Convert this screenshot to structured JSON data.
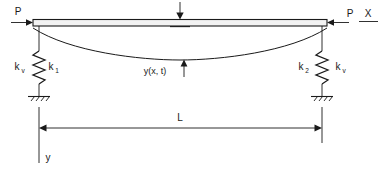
{
  "figure": {
    "type": "engineering-schematic",
    "background_color": "#ffffff",
    "line_color": "#1a1a1a",
    "beam_fill_color": "#f2f2f2"
  },
  "labels": {
    "axial_load_left": "P",
    "axial_load_right": "P",
    "axis_x": "X",
    "axis_y": "y",
    "deflection": "y(x, t)",
    "span": "L",
    "spring_left_outer_base": "k",
    "spring_left_outer_sub": "v",
    "spring_left_inner_base": "k",
    "spring_left_inner_sub": "1",
    "spring_right_inner_base": "k",
    "spring_right_inner_sub": "2",
    "spring_right_outer_base": "k",
    "spring_right_outer_sub": "v"
  },
  "annotations": {
    "center_load_arrow": "downward-point-load-arrow",
    "deflection_arrow": "upward-pointer-to-deflected-shape",
    "left_axial_arrow": "rightward-axial-load-arrow",
    "right_axial_arrow": "leftward-axial-load-arrow",
    "span_dimension": "double-headed-dimension-line"
  },
  "geometry": {
    "beam_left_x": 33,
    "beam_right_x": 327,
    "beam_top_y": 19,
    "beam_bottom_y": 26,
    "midspan_x": 180,
    "max_deflection_y": 53,
    "dimension_line_y": 128,
    "ground_y": 97
  }
}
